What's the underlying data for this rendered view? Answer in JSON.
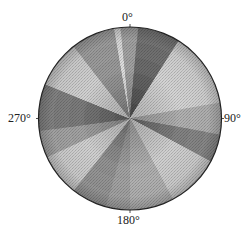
{
  "chart_data": {
    "type": "heatmap",
    "subtype": "polar-density",
    "title": "",
    "angular_ticks": [
      "0°",
      "90°",
      "180°",
      "270°"
    ],
    "angular_tick_positions_deg": [
      0,
      90,
      180,
      270
    ],
    "direction": "clockwise",
    "zero_location": "top",
    "radial_ticks": [],
    "grid": false,
    "legend": null,
    "colormap": "grayscale (darker = higher density)",
    "sectors": [
      {
        "start_deg": 0,
        "end_deg": 5,
        "density": 0.45
      },
      {
        "start_deg": 5,
        "end_deg": 32,
        "density": 0.8
      },
      {
        "start_deg": 32,
        "end_deg": 80,
        "density": 0.12
      },
      {
        "start_deg": 80,
        "end_deg": 100,
        "density": 0.35
      },
      {
        "start_deg": 100,
        "end_deg": 118,
        "density": 0.65
      },
      {
        "start_deg": 118,
        "end_deg": 152,
        "density": 0.15
      },
      {
        "start_deg": 152,
        "end_deg": 180,
        "density": 0.35
      },
      {
        "start_deg": 180,
        "end_deg": 195,
        "density": 0.45
      },
      {
        "start_deg": 195,
        "end_deg": 218,
        "density": 0.55
      },
      {
        "start_deg": 218,
        "end_deg": 245,
        "density": 0.15
      },
      {
        "start_deg": 245,
        "end_deg": 262,
        "density": 0.45
      },
      {
        "start_deg": 262,
        "end_deg": 292,
        "density": 0.7
      },
      {
        "start_deg": 292,
        "end_deg": 322,
        "density": 0.15
      },
      {
        "start_deg": 322,
        "end_deg": 350,
        "density": 0.5
      },
      {
        "start_deg": 350,
        "end_deg": 354,
        "density": 0.05
      },
      {
        "start_deg": 354,
        "end_deg": 360,
        "density": 0.45
      }
    ]
  },
  "labels": {
    "north": "0°",
    "east": "90°",
    "south": "180°",
    "west": "270°"
  },
  "style": {
    "outline_color": "#222222",
    "dark_color": "#3a3a3a",
    "light_color": "#f4f4f4"
  }
}
